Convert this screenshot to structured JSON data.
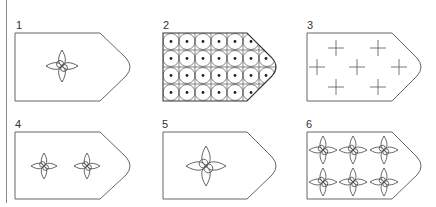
{
  "figure": {
    "stroke_color": "#555555",
    "panels": [
      {
        "label": "1",
        "pattern": "single-small-quatrefoil-star",
        "count": 1
      },
      {
        "label": "2",
        "pattern": "dense-grid-of-circles-with-dots",
        "count": 24
      },
      {
        "label": "3",
        "pattern": "scattered-crosses",
        "count": 7
      },
      {
        "label": "4",
        "pattern": "two-small-quatrefoil-stars",
        "count": 2
      },
      {
        "label": "5",
        "pattern": "single-large-quatrefoil-star",
        "count": 1
      },
      {
        "label": "6",
        "pattern": "six-quatrefoil-stars-2x3",
        "count": 6
      }
    ]
  }
}
